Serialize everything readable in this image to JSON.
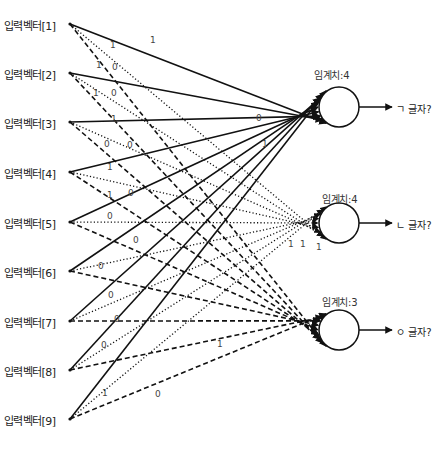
{
  "inputs": [
    {
      "label": "입력벡터[1]",
      "y": 24
    },
    {
      "label": "입력벡터[2]",
      "y": 73
    },
    {
      "label": "입력벡터[3]",
      "y": 122
    },
    {
      "label": "입력벡터[4]",
      "y": 172
    },
    {
      "label": "입력벡터[5]",
      "y": 222
    },
    {
      "label": "입력벡터[6]",
      "y": 271
    },
    {
      "label": "입력벡터[7]",
      "y": 321
    },
    {
      "label": "입력벡터[8]",
      "y": 370
    },
    {
      "label": "입력벡터[9]",
      "y": 419
    }
  ],
  "neurons": [
    {
      "threshold_label": "임계치:4",
      "output_label": "ㄱ 글자?",
      "cx": 339,
      "cy": 107,
      "r": 20,
      "line_style": "solid"
    },
    {
      "threshold_label": "임계치:4",
      "output_label": "ㄴ 글자?",
      "cx": 339,
      "cy": 223,
      "r": 20,
      "line_style": "dotted"
    },
    {
      "threshold_label": "임계치:3",
      "output_label": "ㅇ 글자?",
      "cx": 339,
      "cy": 330,
      "r": 20,
      "line_style": "dashed"
    }
  ],
  "weight_labels": [
    {
      "text": "1",
      "x": 150,
      "y": 41
    },
    {
      "text": "1",
      "x": 110,
      "y": 46
    },
    {
      "text": "1",
      "x": 96,
      "y": 66
    },
    {
      "text": "0",
      "x": 112,
      "y": 68
    },
    {
      "text": "1",
      "x": 93,
      "y": 94
    },
    {
      "text": "0",
      "x": 111,
      "y": 94
    },
    {
      "text": "1",
      "x": 111,
      "y": 120
    },
    {
      "text": "0",
      "x": 104,
      "y": 145
    },
    {
      "text": "0",
      "x": 127,
      "y": 146
    },
    {
      "text": "0",
      "x": 256,
      "y": 119
    },
    {
      "text": "1",
      "x": 262,
      "y": 145
    },
    {
      "text": "1",
      "x": 107,
      "y": 168
    },
    {
      "text": "1",
      "x": 107,
      "y": 196
    },
    {
      "text": "0",
      "x": 128,
      "y": 194
    },
    {
      "text": "0",
      "x": 107,
      "y": 217
    },
    {
      "text": "0",
      "x": 133,
      "y": 241
    },
    {
      "text": "0",
      "x": 98,
      "y": 267
    },
    {
      "text": "1",
      "x": 288,
      "y": 245
    },
    {
      "text": "1",
      "x": 300,
      "y": 245
    },
    {
      "text": "1",
      "x": 316,
      "y": 248
    },
    {
      "text": "0",
      "x": 108,
      "y": 296
    },
    {
      "text": "0",
      "x": 114,
      "y": 320
    },
    {
      "text": "0",
      "x": 101,
      "y": 346
    },
    {
      "text": "1",
      "x": 217,
      "y": 345
    },
    {
      "text": "1",
      "x": 102,
      "y": 394
    },
    {
      "text": "0",
      "x": 155,
      "y": 395
    }
  ],
  "caption": "",
  "colors": {
    "line": "#111111",
    "text": "#222222",
    "background": "#ffffff"
  }
}
